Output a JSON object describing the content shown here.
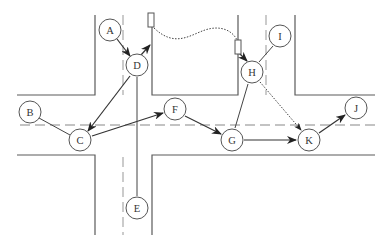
{
  "diagram": {
    "type": "road-network-graph",
    "nodes": [
      {
        "id": "A",
        "label": "A",
        "x": 110,
        "y": 30
      },
      {
        "id": "B",
        "label": "B",
        "x": 30,
        "y": 112
      },
      {
        "id": "C",
        "label": "C",
        "x": 80,
        "y": 140
      },
      {
        "id": "D",
        "label": "D",
        "x": 137,
        "y": 65
      },
      {
        "id": "E",
        "label": "E",
        "x": 137,
        "y": 208
      },
      {
        "id": "F",
        "label": "F",
        "x": 175,
        "y": 109
      },
      {
        "id": "G",
        "label": "G",
        "x": 232,
        "y": 140
      },
      {
        "id": "H",
        "label": "H",
        "x": 252,
        "y": 72
      },
      {
        "id": "I",
        "label": "I",
        "x": 280,
        "y": 36
      },
      {
        "id": "J",
        "label": "J",
        "x": 356,
        "y": 108
      },
      {
        "id": "K",
        "label": "K",
        "x": 309,
        "y": 140
      }
    ],
    "edges": [
      {
        "from": "A",
        "to": "D",
        "style": "arrow"
      },
      {
        "from": "D",
        "to": "C",
        "style": "arrow"
      },
      {
        "from": "B",
        "to": "C",
        "style": "plain"
      },
      {
        "from": "C",
        "to": "F",
        "style": "arrow"
      },
      {
        "from": "D",
        "to": "E",
        "style": "plain"
      },
      {
        "from": "F",
        "to": "G",
        "style": "arrow"
      },
      {
        "from": "G",
        "to": "K",
        "style": "arrow"
      },
      {
        "from": "H",
        "to": "G",
        "style": "plain"
      },
      {
        "from": "H",
        "to": "I",
        "style": "plain"
      },
      {
        "from": "H",
        "to": "K",
        "style": "dotted-arrow"
      },
      {
        "from": "K",
        "to": "J",
        "style": "arrow"
      },
      {
        "from": "D",
        "to": "marker-1",
        "style": "arrow"
      },
      {
        "from": "marker-2",
        "to": "H",
        "style": "arrow"
      },
      {
        "from": "marker-1",
        "to": "marker-2",
        "style": "dotted-curve"
      }
    ],
    "markers": [
      {
        "id": "marker-1",
        "x": 151,
        "y": 22
      },
      {
        "id": "marker-2",
        "x": 238,
        "y": 44
      }
    ]
  }
}
